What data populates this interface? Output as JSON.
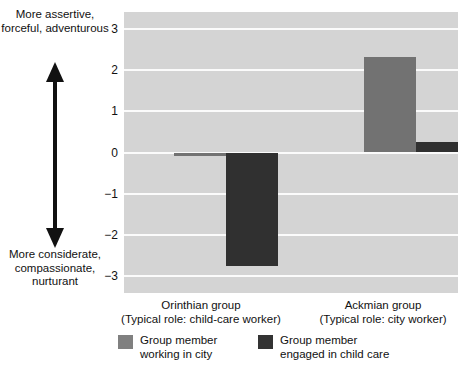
{
  "axis_annotation": {
    "top_label": "More\nassertive,\nforceful,\nadventurous",
    "bottom_label": "More\nconsiderate,\ncompassionate,\nnurturant",
    "arrow_icon": "double-headed-vertical-arrow-icon"
  },
  "legend": {
    "items": [
      {
        "label": "Group member\nworking in city",
        "color": "#808080",
        "key": "city"
      },
      {
        "label": "Group member\nengaged in child care",
        "color": "#333333",
        "key": "childcare"
      }
    ]
  },
  "caption": {
    "text": ""
  },
  "chart_data": {
    "type": "bar",
    "title": "",
    "xlabel": "",
    "ylabel": "",
    "ylim": [
      -3.4,
      3.4
    ],
    "yticks": [
      3,
      2,
      1,
      0,
      -1,
      -2,
      -3
    ],
    "ytick_labels": [
      "3",
      "2",
      "1",
      "0",
      "−1",
      "−2",
      "−3"
    ],
    "grid": true,
    "grid_color": "#fbfbfb",
    "plot_background": "#d4d4d4",
    "legend_position": "bottom",
    "categories": [
      "Orinthian group\n(Typical role: child-care worker)",
      "Ackmian group\n(Typical role: city worker)"
    ],
    "category_names": [
      "Orinthian group",
      "Ackmian group"
    ],
    "category_sublabels": [
      "(Typical role: child-care worker)",
      "(Typical role: city worker)"
    ],
    "series": [
      {
        "name": "Group member working in city",
        "color": "#727272",
        "values": [
          -0.08,
          2.3
        ]
      },
      {
        "name": "Group member engaged in child care",
        "color": "#303030",
        "values": [
          -2.75,
          0.25
        ]
      }
    ]
  }
}
